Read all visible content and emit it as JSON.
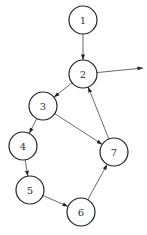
{
  "diagram": {
    "type": "directed-graph",
    "nodes": [
      {
        "id": "1",
        "label": "1",
        "x": 83,
        "y": 20
      },
      {
        "id": "2",
        "label": "2",
        "x": 83,
        "y": 74
      },
      {
        "id": "3",
        "label": "3",
        "x": 43,
        "y": 106
      },
      {
        "id": "4",
        "label": "4",
        "x": 23,
        "y": 146
      },
      {
        "id": "5",
        "label": "5",
        "x": 30,
        "y": 190
      },
      {
        "id": "6",
        "label": "6",
        "x": 81,
        "y": 212
      },
      {
        "id": "7",
        "label": "7",
        "x": 114,
        "y": 152
      }
    ],
    "edges": [
      {
        "from": "1",
        "to": "2"
      },
      {
        "from": "2",
        "to": "3"
      },
      {
        "from": "2",
        "to": "exit"
      },
      {
        "from": "3",
        "to": "4"
      },
      {
        "from": "3",
        "to": "7"
      },
      {
        "from": "4",
        "to": "5"
      },
      {
        "from": "5",
        "to": "6"
      },
      {
        "from": "6",
        "to": "7"
      },
      {
        "from": "7",
        "to": "2"
      }
    ],
    "exit_point": {
      "x": 143,
      "y": 68
    },
    "node_radius": 14
  }
}
